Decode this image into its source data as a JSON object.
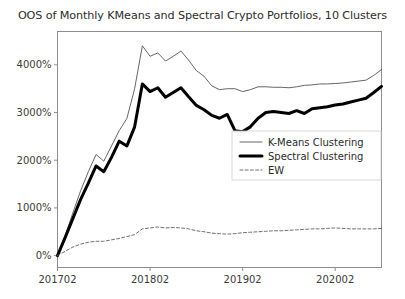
{
  "figure": {
    "title": "OOS of Monthly KMeans and Spectral Crypto Portfolios, 10 Clusters",
    "background": "#ffffff"
  },
  "chart_data": {
    "type": "line",
    "title": "OOS of Monthly KMeans and Spectral Crypto Portfolios, 10 Clusters",
    "xlabel": "",
    "ylabel": "",
    "grid": false,
    "legend_position": "center-right",
    "xlim": [
      201702,
      202008
    ],
    "ylim": [
      -250,
      4700
    ],
    "xticks": [
      201702,
      201802,
      201902,
      202002
    ],
    "xticklabels": [
      "201702",
      "201802",
      "201902",
      "202002"
    ],
    "yticks": [
      0,
      1000,
      2000,
      3000,
      4000
    ],
    "yticklabels": [
      "0%",
      "1000%",
      "2000%",
      "3000%",
      "4000%"
    ],
    "x": [
      201702,
      201703,
      201704,
      201705,
      201706,
      201707,
      201708,
      201709,
      201710,
      201711,
      201712,
      201801,
      201802,
      201803,
      201804,
      201805,
      201806,
      201807,
      201808,
      201809,
      201810,
      201811,
      201812,
      201901,
      201902,
      201903,
      201904,
      201905,
      201906,
      201907,
      201908,
      201909,
      201910,
      201911,
      201912,
      202001,
      202002,
      202003,
      202004,
      202005,
      202006,
      202007,
      202008
    ],
    "series": [
      {
        "name": "K-Means Clustering",
        "color": "#555555",
        "linewidth": 0.9,
        "linestyle": "solid",
        "values": [
          0,
          420,
          900,
          1360,
          1760,
          2120,
          1980,
          2300,
          2620,
          2880,
          3500,
          4400,
          4180,
          4250,
          4080,
          4180,
          4290,
          4100,
          3880,
          3760,
          3560,
          3480,
          3500,
          3500,
          3440,
          3480,
          3540,
          3540,
          3530,
          3530,
          3520,
          3540,
          3570,
          3580,
          3600,
          3600,
          3610,
          3620,
          3640,
          3660,
          3680,
          3780,
          3900
        ]
      },
      {
        "name": "Spectral Clustering",
        "color": "#000000",
        "linewidth": 3.0,
        "linestyle": "solid",
        "values": [
          0,
          380,
          780,
          1180,
          1520,
          1880,
          1760,
          2060,
          2400,
          2300,
          2700,
          3600,
          3440,
          3520,
          3320,
          3420,
          3520,
          3330,
          3150,
          3060,
          2940,
          2880,
          2960,
          2620,
          2600,
          2700,
          2880,
          3000,
          3020,
          3000,
          2980,
          3040,
          2980,
          3080,
          3100,
          3120,
          3160,
          3180,
          3220,
          3260,
          3300,
          3420,
          3550
        ]
      },
      {
        "name": "EW",
        "color": "#606060",
        "linewidth": 0.9,
        "linestyle": "dashed",
        "values": [
          0,
          90,
          180,
          240,
          280,
          300,
          300,
          330,
          360,
          400,
          440,
          560,
          580,
          600,
          580,
          590,
          580,
          560,
          520,
          500,
          470,
          460,
          450,
          460,
          480,
          490,
          500,
          510,
          520,
          520,
          530,
          540,
          550,
          560,
          560,
          570,
          580,
          570,
          560,
          560,
          560,
          560,
          570
        ]
      }
    ]
  },
  "legend": {
    "entries": [
      {
        "label": "K-Means Clustering"
      },
      {
        "label": "Spectral Clustering"
      },
      {
        "label": "EW"
      }
    ]
  }
}
